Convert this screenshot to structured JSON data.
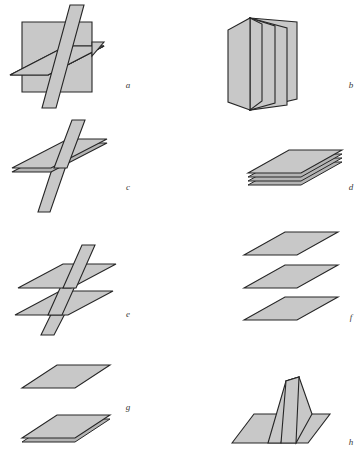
{
  "figure": {
    "background_color": "#ffffff",
    "fill_color": "#c8c8c8",
    "fill_color_shadow": "#b4b4b4",
    "fill_color_light": "#d2d2d2",
    "edge_color": "#262626",
    "label_color": "#3a3a3a",
    "panels": [
      {
        "id": "a",
        "label": "a",
        "label_x": 128,
        "label_y": 88,
        "description": "Three mutually intersecting planes: a frontal vertical square, a horizontal plane passing through it, and a slanted vertical plane cutting both."
      },
      {
        "id": "b",
        "label": "b",
        "label_x": 351,
        "label_y": 88,
        "description": "Accordion-folded sheet of four panels converging at a common top-left edge, standing upright."
      },
      {
        "id": "c",
        "label": "c",
        "label_x": 128,
        "label_y": 190,
        "description": "A single horizontal plane pierced by one slanted vertical plane."
      },
      {
        "id": "d",
        "label": "d",
        "label_x": 351,
        "label_y": 190,
        "description": "A compact stack of four thin parallel sheets lying flat in contact."
      },
      {
        "id": "e",
        "label": "e",
        "label_x": 128,
        "label_y": 317,
        "description": "Two parallel horizontal planes both pierced by a single slanted vertical plane."
      },
      {
        "id": "f",
        "label": "f",
        "label_x": 351,
        "label_y": 320,
        "description": "Three separated parallel horizontal planes stacked with gaps between them."
      },
      {
        "id": "g",
        "label": "g",
        "label_x": 128,
        "label_y": 410,
        "description": "A single horizontal plane above a two-sheet stack in contact."
      },
      {
        "id": "h",
        "label": "h",
        "label_x": 351,
        "label_y": 445,
        "description": "A horizontal plane with a V-shaped folded sheet standing upright on it."
      }
    ]
  }
}
